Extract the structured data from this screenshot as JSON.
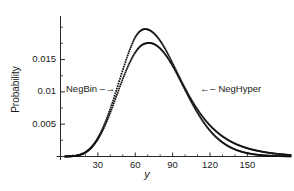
{
  "chart_data": {
    "type": "line",
    "title": "",
    "xlabel": "y",
    "ylabel": "Probability",
    "xlim": [
      0,
      185
    ],
    "ylim": [
      0,
      0.0205
    ],
    "grid": false,
    "legend_position": "inline-annotations",
    "xticks": [
      30,
      60,
      90,
      120,
      150
    ],
    "xtick_labels": [
      "30",
      "60",
      "90",
      "120",
      "150"
    ],
    "yticks": [
      0.005,
      0.01,
      0.015
    ],
    "ytick_labels": [
      "0.005",
      "0.01",
      "0.015"
    ],
    "marker": "dotted",
    "annotations": [
      {
        "text": "NegBin",
        "arrow": "–→",
        "points_to": "left-curve",
        "x": 52,
        "y": 0.0103
      },
      {
        "text": "NegHyper",
        "arrow": "←–",
        "points_to": "right-curve",
        "x": 128,
        "y": 0.0103
      }
    ],
    "series": [
      {
        "name": "NegBin",
        "color": "#111111",
        "peak_x": 77,
        "peak_y": 0.01755,
        "x": [
          0,
          5,
          10,
          15,
          20,
          25,
          30,
          35,
          40,
          45,
          50,
          55,
          60,
          65,
          70,
          75,
          80,
          85,
          90,
          95,
          100,
          105,
          110,
          115,
          120,
          125,
          130,
          135,
          140,
          145,
          150,
          155,
          160,
          165,
          170,
          175,
          180,
          185
        ],
        "values": [
          0.0,
          1e-05,
          6e-05,
          0.00022,
          0.00062,
          0.0014,
          0.00268,
          0.0045,
          0.0068,
          0.0094,
          0.012,
          0.0143,
          0.0161,
          0.0172,
          0.01755,
          0.0174,
          0.0167,
          0.01555,
          0.014,
          0.0122,
          0.0103,
          0.00845,
          0.00675,
          0.00525,
          0.004,
          0.00298,
          0.00218,
          0.00156,
          0.0011,
          0.00076,
          0.00052,
          0.00035,
          0.00023,
          0.00015,
          0.0001,
          6e-05,
          4e-05,
          2e-05
        ]
      },
      {
        "name": "NegHyper",
        "color": "#111111",
        "peak_x": 77,
        "peak_y": 0.01965,
        "x": [
          0,
          5,
          10,
          15,
          20,
          25,
          30,
          35,
          40,
          45,
          50,
          55,
          60,
          65,
          70,
          75,
          80,
          85,
          90,
          95,
          100,
          105,
          110,
          115,
          120,
          125,
          130,
          135,
          140,
          145,
          150,
          155,
          160,
          165,
          170,
          175,
          180,
          185
        ],
        "values": [
          0.0,
          1e-05,
          6e-05,
          0.00023,
          0.00066,
          0.0015,
          0.00288,
          0.00487,
          0.00742,
          0.01035,
          0.0134,
          0.0162,
          0.01845,
          0.01955,
          0.01965,
          0.01905,
          0.0179,
          0.0163,
          0.0144,
          0.01245,
          0.01055,
          0.0088,
          0.00725,
          0.00592,
          0.0048,
          0.00388,
          0.00312,
          0.0025,
          0.002,
          0.0016,
          0.00128,
          0.00102,
          0.00081,
          0.00064,
          0.0005,
          0.00039,
          0.0003,
          0.00023
        ]
      }
    ]
  },
  "figure": {
    "background_color": "#ffffff",
    "axis_color": "#2a2a2a"
  }
}
